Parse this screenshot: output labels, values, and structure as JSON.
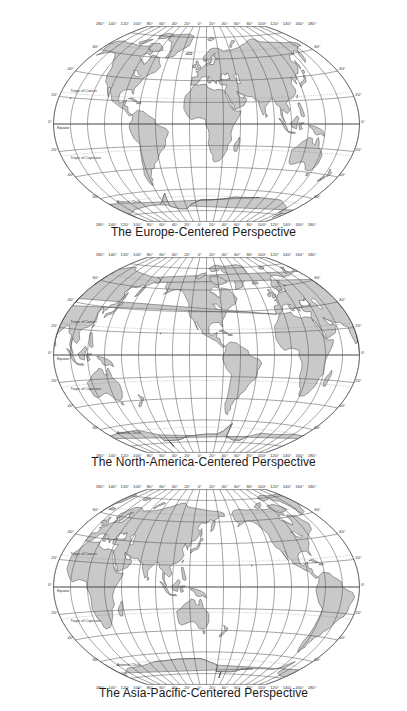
{
  "figure": {
    "maps": [
      {
        "id": "europe",
        "caption": "The Europe-Centered Perspective",
        "central_meridian": 10,
        "top": 0,
        "height": 240,
        "center_y": 124,
        "caption_y": 225
      },
      {
        "id": "north-america",
        "caption": "The North-America-Centered Perspective",
        "central_meridian": -100,
        "top": 235,
        "height": 240,
        "center_y": 120,
        "caption_y": 220
      },
      {
        "id": "asia-pacific",
        "caption": "The Asia-Pacific-Centered Perspective",
        "central_meridian": 150,
        "top": 468,
        "height": 243,
        "center_y": 119,
        "caption_y": 218
      }
    ],
    "longitude_tick_labels": [
      "180°",
      "140°",
      "120°",
      "100°",
      "80°",
      "60°",
      "40°",
      "20°",
      "0°",
      "20°",
      "40°",
      "60°",
      "80°",
      "100°",
      "120°",
      "140°",
      "160°",
      "180°"
    ],
    "latitude_tick_labels": {
      "left": [
        "60°",
        "40°",
        "20°",
        "0°",
        "20°",
        "40°",
        "60°"
      ],
      "right": [
        "60°",
        "40°",
        "20°",
        "0°",
        "20°",
        "40°",
        "60°"
      ]
    },
    "circle_labels": {
      "tropic_cancer": "Tropic of Cancer",
      "equator": "Equator",
      "tropic_capricorn": "Tropic of Capricorn",
      "antarctic": "Antarctic Circle",
      "arctic": "Arctic Circle"
    },
    "colors": {
      "land": "#c9c9c9",
      "coast": "#3a3a3a",
      "graticule": "#4a4a4a",
      "background": "#ffffff",
      "caption": "#1a1a1a"
    }
  }
}
